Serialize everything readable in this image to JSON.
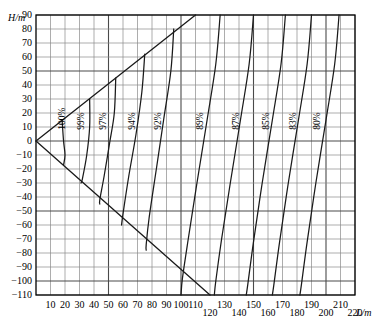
{
  "chart_data": {
    "type": "line",
    "title": "",
    "xlabel": "L/m",
    "ylabel": "H/m",
    "xlim": [
      0,
      220
    ],
    "ylim": [
      -110,
      90
    ],
    "grid": true,
    "legend_position": "inline-curve-labels",
    "x_ticks": [
      10,
      20,
      30,
      40,
      50,
      60,
      70,
      80,
      90,
      100,
      110,
      120,
      130,
      140,
      150,
      160,
      170,
      180,
      190,
      200,
      210,
      220
    ],
    "x_tick_labels": [
      "10",
      "20",
      "30",
      "40",
      "50",
      "60",
      "70",
      "80",
      "90",
      "100",
      "110",
      "120",
      "130",
      "140",
      "150",
      "160",
      "170",
      "180",
      "190",
      "200",
      "210",
      "220"
    ],
    "y_ticks": [
      90,
      80,
      70,
      60,
      50,
      40,
      30,
      20,
      10,
      0,
      -10,
      -20,
      -30,
      -40,
      -50,
      -60,
      -70,
      -80,
      -90,
      -100,
      -110
    ],
    "y_tick_labels": [
      "90",
      "80",
      "70",
      "60",
      "50",
      "40",
      "30",
      "20",
      "10",
      "0",
      "-10",
      "-20",
      "-30",
      "-40",
      "-50",
      "-60",
      "-70",
      "-80",
      "-90",
      "-100",
      "-110"
    ],
    "envelopes": [
      {
        "name": "upper-envelope",
        "points": [
          [
            0,
            0
          ],
          [
            110,
            90
          ]
        ]
      },
      {
        "name": "lower-envelope",
        "points": [
          [
            0,
            0
          ],
          [
            120,
            -110
          ]
        ]
      }
    ],
    "series": [
      {
        "name": "100%",
        "label": "100%",
        "label_x": 20,
        "label_y": 8,
        "points": [
          [
            18,
            15
          ],
          [
            19,
            0
          ],
          [
            20,
            -10
          ],
          [
            19,
            -17
          ]
        ]
      },
      {
        "name": "99%",
        "label": "99%",
        "label_x": 33,
        "label_y": 8,
        "points": [
          [
            37,
            30
          ],
          [
            37,
            10
          ],
          [
            35,
            -10
          ],
          [
            32,
            -27
          ],
          [
            31,
            -30
          ]
        ]
      },
      {
        "name": "97%",
        "label": "97%",
        "label_x": 48,
        "label_y": 8,
        "points": [
          [
            55,
            45
          ],
          [
            54,
            20
          ],
          [
            51,
            0
          ],
          [
            47,
            -25
          ],
          [
            44,
            -42
          ],
          [
            44,
            -45
          ]
        ]
      },
      {
        "name": "94%",
        "label": "94%",
        "label_x": 68,
        "label_y": 8,
        "points": [
          [
            75,
            62
          ],
          [
            73,
            35
          ],
          [
            69,
            5
          ],
          [
            64,
            -25
          ],
          [
            60,
            -52
          ],
          [
            59,
            -60
          ]
        ]
      },
      {
        "name": "92%",
        "label": "92%",
        "label_x": 86,
        "label_y": 8,
        "points": [
          [
            95,
            80
          ],
          [
            93,
            50
          ],
          [
            88,
            15
          ],
          [
            83,
            -20
          ],
          [
            78,
            -55
          ],
          [
            76,
            -74
          ],
          [
            76,
            -78
          ]
        ]
      },
      {
        "name": "89%",
        "label": "89%",
        "label_x": 115,
        "label_y": 8,
        "points": [
          [
            127,
            90
          ],
          [
            124,
            55
          ],
          [
            118,
            15
          ],
          [
            111,
            -30
          ],
          [
            105,
            -70
          ],
          [
            101,
            -98
          ],
          [
            100,
            -110
          ]
        ]
      },
      {
        "name": "87%",
        "label": "87%",
        "label_x": 140,
        "label_y": 8,
        "points": [
          [
            150,
            90
          ],
          [
            147,
            55
          ],
          [
            141,
            15
          ],
          [
            134,
            -30
          ],
          [
            128,
            -70
          ],
          [
            124,
            -100
          ],
          [
            123,
            -110
          ]
        ]
      },
      {
        "name": "85%",
        "label": "85%",
        "label_x": 161,
        "label_y": 8,
        "points": [
          [
            172,
            90
          ],
          [
            169,
            55
          ],
          [
            163,
            15
          ],
          [
            156,
            -30
          ],
          [
            150,
            -72
          ],
          [
            146,
            -103
          ],
          [
            145,
            -110
          ]
        ]
      },
      {
        "name": "83%",
        "label": "83%",
        "label_x": 179,
        "label_y": 8,
        "points": [
          [
            190,
            90
          ],
          [
            187,
            55
          ],
          [
            181,
            15
          ],
          [
            174,
            -30
          ],
          [
            168,
            -72
          ],
          [
            164,
            -103
          ],
          [
            163,
            -110
          ]
        ]
      },
      {
        "name": "80%",
        "label": "80%",
        "label_x": 196,
        "label_y": 8,
        "points": [
          [
            209,
            90
          ],
          [
            206,
            55
          ],
          [
            200,
            15
          ],
          [
            193,
            -30
          ],
          [
            187,
            -72
          ],
          [
            183,
            -103
          ],
          [
            182,
            -110
          ]
        ]
      }
    ],
    "colors": {
      "curve": "#1a1a1a",
      "grid_minor": "#8a8a8a",
      "grid_major": "#4a4a4a",
      "axis": "#000000",
      "background": "#ffffff"
    }
  }
}
